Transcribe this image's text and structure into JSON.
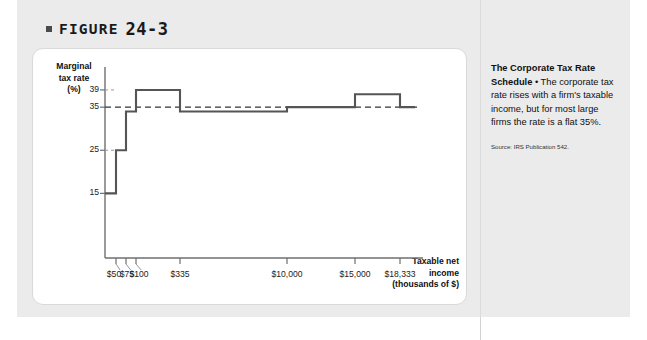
{
  "figure": {
    "label": "FIGURE",
    "number": "24-3",
    "bullet_icon": "filled-square-bullet"
  },
  "caption": {
    "heading": "The Corporate Tax Rate Schedule",
    "separator": " • ",
    "body": "The corporate tax rate rises with a firm's taxable income, but for most large firms the rate is a flat 35%.",
    "source": "Source: IRS Publication 542."
  },
  "colors": {
    "page_background": "#ebebeb",
    "panel_background": "#ffffff",
    "panel_border": "#d9d9d9",
    "axis": "#6f6f6f",
    "step_line": "#555555",
    "reference_line": "#333333",
    "text": "#111111"
  },
  "chart_data": {
    "type": "line",
    "title": "The Corporate Tax Rate Schedule",
    "xlabel": "Taxable net income (thousands of $)",
    "ylabel": "Marginal tax rate (%)",
    "ylim": [
      0,
      42
    ],
    "grid": false,
    "legend": null,
    "y_ticks": [
      39,
      35,
      25,
      15
    ],
    "x_ticks": [
      "$50",
      "$75",
      "$100",
      "$335",
      "$10,000",
      "$15,000",
      "$18,333"
    ],
    "x_tick_values": [
      50,
      75,
      100,
      335,
      10000,
      15000,
      18333
    ],
    "reference_line": {
      "value": 35,
      "style": "dashed",
      "label": "35"
    },
    "step_series": {
      "name": "Marginal tax rate",
      "style": "step",
      "brackets": [
        {
          "from": "$0",
          "to": "$50",
          "rate": 15
        },
        {
          "from": "$50",
          "to": "$75",
          "rate": 25
        },
        {
          "from": "$75",
          "to": "$100",
          "rate": 34
        },
        {
          "from": "$100",
          "to": "$335",
          "rate": 39
        },
        {
          "from": "$335",
          "to": "$10,000",
          "rate": 34
        },
        {
          "from": "$10,000",
          "to": "$15,000",
          "rate": 35
        },
        {
          "from": "$15,000",
          "to": "$18,333",
          "rate": 38
        },
        {
          "from": "$18,333",
          "to": "above",
          "rate": 35
        }
      ],
      "values": [
        15,
        25,
        34,
        39,
        34,
        35,
        38,
        35
      ]
    },
    "axis_titles": {
      "y_line1": "Marginal",
      "y_line2": "tax rate",
      "y_line3": "(%)",
      "x_line1": "Taxable net",
      "x_line2": "income",
      "x_line3": "(thousands of $)"
    }
  }
}
